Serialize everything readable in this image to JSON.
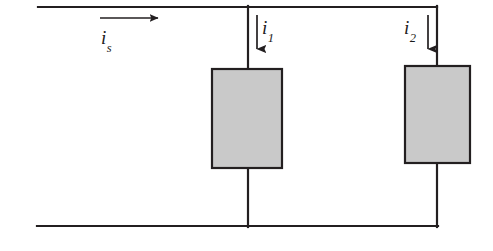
{
  "diagram": {
    "type": "electrical-circuit-schematic",
    "background_color": "#ffffff",
    "wire_color": "#231f20",
    "wire_width": 2.2,
    "component_fill": "#c9c9c9",
    "component_stroke": "#231f20",
    "labels": {
      "source_current": {
        "symbol": "i",
        "subscript": "s"
      },
      "branch1_current": {
        "symbol": "i",
        "subscript": "1"
      },
      "branch2_current": {
        "symbol": "i",
        "subscript": "2"
      }
    },
    "geometry": {
      "top_wire": {
        "x1": 38,
        "y1": 7,
        "x2": 437,
        "y2": 7
      },
      "bottom_wire": {
        "x1": 37,
        "y1": 226,
        "x2": 437,
        "y2": 226
      },
      "middle_branch": {
        "x": 248,
        "y1": 7,
        "y2": 226
      },
      "right_branch": {
        "x": 437,
        "y1": 7,
        "y2": 226
      },
      "resistor_left": {
        "x": 212,
        "y": 69,
        "width": 70,
        "height": 99
      },
      "resistor_right": {
        "x": 405,
        "y": 66,
        "width": 65,
        "height": 97
      },
      "arrow_source": {
        "x1": 100,
        "y1": 18,
        "x2": 165,
        "y2": 18,
        "direction": "right"
      },
      "arrow_branch1": {
        "x1": 257,
        "y1": 15,
        "x2": 257,
        "y2": 57,
        "direction": "down"
      },
      "arrow_branch2": {
        "x1": 428,
        "y1": 15,
        "x2": 428,
        "y2": 57,
        "direction": "down"
      }
    }
  }
}
